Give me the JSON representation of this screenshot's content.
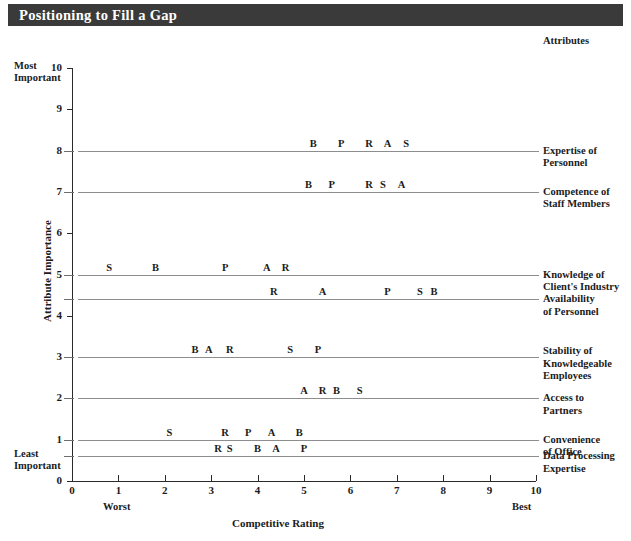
{
  "title": "Positioning to Fill a Gap",
  "axes": {
    "y_title": "Attribute Importance",
    "x_title": "Competitive Rating",
    "y_ticks": [
      "0",
      "1",
      "2",
      "3",
      "4",
      "5",
      "6",
      "7",
      "8",
      "9",
      "10"
    ],
    "x_ticks": [
      "0",
      "1",
      "2",
      "3",
      "4",
      "5",
      "6",
      "7",
      "8",
      "9",
      "10"
    ],
    "most_important": "Most\nImportant",
    "most_important_l1": "Most",
    "most_important_l2": "Important",
    "least_important_l1": "Least",
    "least_important_l2": "Important",
    "worst": "Worst",
    "best": "Best"
  },
  "attributes_heading": "Attributes",
  "chart_data": {
    "type": "scatter",
    "title": "Positioning to Fill a Gap",
    "xlabel": "Competitive Rating",
    "ylabel": "Attribute Importance",
    "xlim": [
      0,
      10
    ],
    "ylim": [
      0,
      10
    ],
    "grid": false,
    "legend_position": "right",
    "marker_labels": [
      "B",
      "P",
      "R",
      "A",
      "S"
    ],
    "rows": [
      {
        "attribute": "Expertise of Personnel",
        "label_l1": "Expertise of",
        "label_l2": "Personnel",
        "importance": 8.0,
        "points": [
          {
            "company": "B",
            "rating": 5.2
          },
          {
            "company": "P",
            "rating": 5.8
          },
          {
            "company": "R",
            "rating": 6.4
          },
          {
            "company": "A",
            "rating": 6.8
          },
          {
            "company": "S",
            "rating": 7.2
          }
        ]
      },
      {
        "attribute": "Competence of Staff Members",
        "label_l1": "Competence of",
        "label_l2": "Staff Members",
        "importance": 7.0,
        "points": [
          {
            "company": "B",
            "rating": 5.1
          },
          {
            "company": "P",
            "rating": 5.6
          },
          {
            "company": "R",
            "rating": 6.4
          },
          {
            "company": "S",
            "rating": 6.7
          },
          {
            "company": "A",
            "rating": 7.1
          }
        ]
      },
      {
        "attribute": "Knowledge of Client's Industry",
        "label_l1": "Knowledge of",
        "label_l2": "Client's Industry",
        "importance": 5.0,
        "points": [
          {
            "company": "S",
            "rating": 0.8
          },
          {
            "company": "B",
            "rating": 1.8
          },
          {
            "company": "P",
            "rating": 3.3
          },
          {
            "company": "A",
            "rating": 4.2
          },
          {
            "company": "R",
            "rating": 4.6
          }
        ]
      },
      {
        "attribute": "Availability of Personnel",
        "label_l1": "Availability",
        "label_l2": "of Personnel",
        "importance": 4.4,
        "points": [
          {
            "company": "R",
            "rating": 4.35
          },
          {
            "company": "A",
            "rating": 5.4
          },
          {
            "company": "P",
            "rating": 6.8
          },
          {
            "company": "S",
            "rating": 7.5
          },
          {
            "company": "B",
            "rating": 7.8
          }
        ]
      },
      {
        "attribute": "Stability of Knowledgeable Employees",
        "label_l1": "Stability of",
        "label_l2": "Knowledgeable",
        "label_l3": "Employees",
        "importance": 3.0,
        "points": [
          {
            "company": "B",
            "rating": 2.65
          },
          {
            "company": "A",
            "rating": 2.95
          },
          {
            "company": "R",
            "rating": 3.4
          },
          {
            "company": "S",
            "rating": 4.7
          },
          {
            "company": "P",
            "rating": 5.3
          }
        ]
      },
      {
        "attribute": "Access to Partners",
        "label_l1": "Access to",
        "label_l2": "Partners",
        "importance": 2.0,
        "points": [
          {
            "company": "A",
            "rating": 5.0
          },
          {
            "company": "R",
            "rating": 5.4
          },
          {
            "company": "B",
            "rating": 5.7
          },
          {
            "company": "S",
            "rating": 6.2
          }
        ]
      },
      {
        "attribute": "Convenience of Office",
        "label_l1": "Convenience",
        "label_l2": "of Office",
        "importance": 1.0,
        "points": [
          {
            "company": "S",
            "rating": 2.1
          },
          {
            "company": "R",
            "rating": 3.3
          },
          {
            "company": "P",
            "rating": 3.8
          },
          {
            "company": "A",
            "rating": 4.3
          },
          {
            "company": "B",
            "rating": 4.9
          }
        ]
      },
      {
        "attribute": "Data Processing Expertise",
        "label_l1": "Data Processing",
        "label_l2": "Expertise",
        "importance": 0.6,
        "points": [
          {
            "company": "R",
            "rating": 3.15
          },
          {
            "company": "S",
            "rating": 3.4
          },
          {
            "company": "B",
            "rating": 4.0
          },
          {
            "company": "A",
            "rating": 4.4
          },
          {
            "company": "P",
            "rating": 5.0
          }
        ]
      }
    ]
  }
}
